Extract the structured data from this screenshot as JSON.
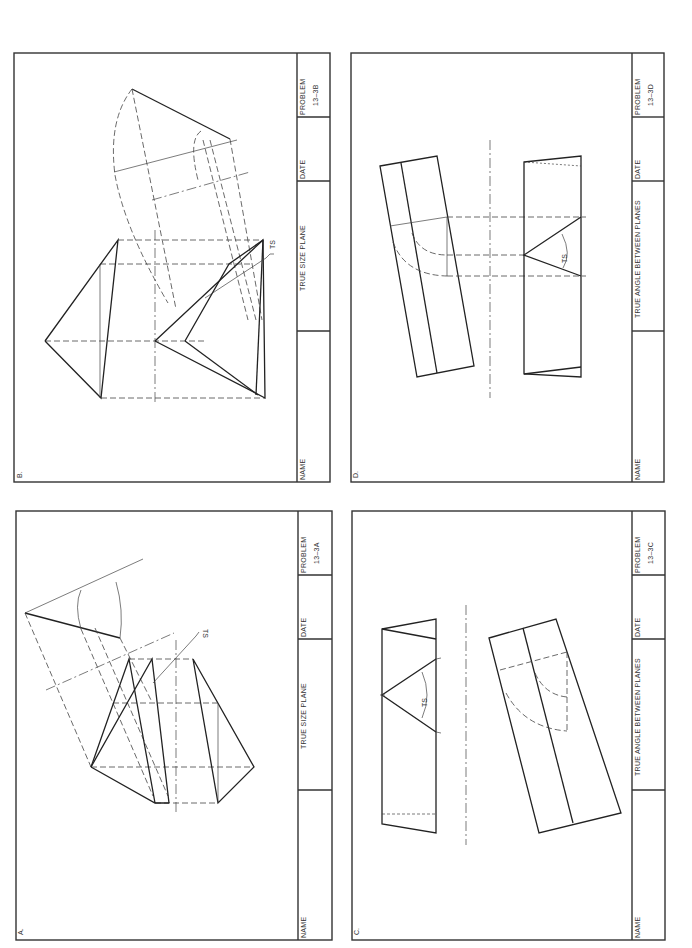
{
  "sheet": {
    "panels": [
      {
        "id": "B",
        "label": "B.",
        "title_block": {
          "name_label": "NAME",
          "title": "TRUE  SIZE  PLANE",
          "date_label": "DATE",
          "problem_label": "PROBLEM",
          "problem_number": "13–3B"
        },
        "annotations": [
          "TS"
        ]
      },
      {
        "id": "D",
        "label": "D.",
        "title_block": {
          "name_label": "NAME",
          "title": "TRUE  ANGLE  BETWEEN  PLANES",
          "date_label": "DATE",
          "problem_label": "PROBLEM",
          "problem_number": "13–3D"
        },
        "annotations": [
          "TS"
        ]
      },
      {
        "id": "A",
        "label": "A.",
        "title_block": {
          "name_label": "NAME",
          "title": "TRUE  SIZE  PLANE",
          "date_label": "DATE",
          "problem_label": "PROBLEM",
          "problem_number": "13–3A"
        },
        "annotations": [
          "TS"
        ]
      },
      {
        "id": "C",
        "label": "C.",
        "title_block": {
          "name_label": "NAME",
          "title": "TRUE  ANGLE  BETWEEN  PLANES",
          "date_label": "DATE",
          "problem_label": "PROBLEM",
          "problem_number": "13–3C"
        },
        "annotations": [
          "TS"
        ]
      }
    ]
  }
}
